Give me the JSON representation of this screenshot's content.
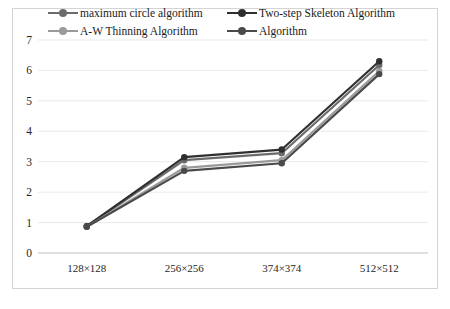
{
  "chart": {
    "type": "line",
    "background_color": "#ffffff",
    "frame_border_color": "#d4d4d4",
    "gridline_color": "#e3e3e3",
    "axis_line_color": "#bfbfbf"
  },
  "legend": {
    "position": "top",
    "columns": 2,
    "items": [
      {
        "label": "maximum circle algorithm",
        "color": "#6b6b6b",
        "marker": "circle"
      },
      {
        "label": "Two-step Skeleton Algorithm",
        "color": "#2f2f2f",
        "marker": "circle"
      },
      {
        "label": "A-W Thinning Algorithm",
        "color": "#9a9a9a",
        "marker": "circle"
      },
      {
        "label": "Algorithm",
        "color": "#4a4a4a",
        "marker": "circle"
      }
    ]
  },
  "chart_data": {
    "type": "line",
    "title": "",
    "xlabel": "",
    "ylabel": "",
    "categories": [
      "128×128",
      "256×256",
      "374×374",
      "512×512"
    ],
    "ylim": [
      0,
      7
    ],
    "yticks": [
      0,
      1,
      2,
      3,
      4,
      5,
      6,
      7
    ],
    "grid": true,
    "legend_position": "top",
    "series": [
      {
        "name": "maximum circle algorithm",
        "color": "#6b6b6b",
        "values": [
          0.88,
          3.05,
          3.28,
          6.18
        ]
      },
      {
        "name": "Two-step Skeleton Algorithm",
        "color": "#2f2f2f",
        "values": [
          0.88,
          3.15,
          3.4,
          6.3
        ]
      },
      {
        "name": "A-W Thinning Algorithm",
        "color": "#9a9a9a",
        "values": [
          0.86,
          2.8,
          3.05,
          5.98
        ]
      },
      {
        "name": "Algorithm",
        "color": "#4a4a4a",
        "values": [
          0.86,
          2.7,
          2.95,
          5.88
        ]
      }
    ]
  }
}
